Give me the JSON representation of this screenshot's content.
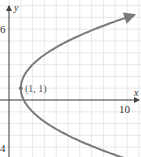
{
  "chart_data": {
    "type": "line",
    "title": "",
    "equation": "(y - 1)^2 = 4(x - 1)",
    "xlabel": "x",
    "ylabel": "y",
    "xlim": [
      -0.8,
      11.3
    ],
    "ylim": [
      -4.8,
      8.4
    ],
    "grid": true,
    "x_tick_labels": [
      {
        "value": 10,
        "label": "10"
      }
    ],
    "y_tick_labels": [
      {
        "value": 6,
        "label": "6"
      },
      {
        "value": -4,
        "label": "4"
      }
    ],
    "series": [
      {
        "name": "parabola",
        "x": [
          10.6,
          9.0,
          7.25,
          5.0,
          3.25,
          2.0,
          1.25,
          1.0,
          1.25,
          2.0,
          3.25,
          5.0,
          7.25,
          9.0
        ],
        "y": [
          7.2,
          6.66,
          6.0,
          5.0,
          4.0,
          3.0,
          2.0,
          1.0,
          0.0,
          -1.0,
          -2.0,
          -3.0,
          -4.0,
          -4.66
        ]
      }
    ],
    "annotations": [
      {
        "x": 1,
        "y": 1,
        "text": "(1, 1)",
        "marker": "dot"
      }
    ]
  },
  "colors": {
    "grid": "#e2e2e2",
    "axis": "#444444",
    "curve": "#7a7a7a",
    "point": "#777777"
  },
  "labels": {
    "x_axis": "x",
    "y_axis": "y",
    "y_tick_top": "6",
    "y_tick_bottom": "4",
    "x_tick_right": "10",
    "point": "(1, 1)"
  }
}
